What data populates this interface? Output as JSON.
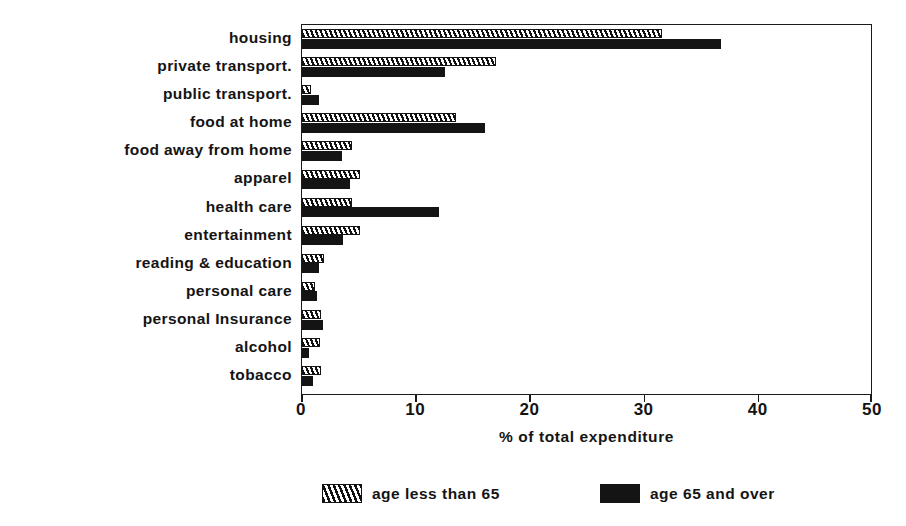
{
  "chart_data": {
    "type": "bar",
    "orientation": "horizontal",
    "title": "",
    "xlabel": "% of total expenditure",
    "ylabel": "",
    "xlim": [
      0,
      50
    ],
    "xticks": [
      0,
      10,
      20,
      30,
      40,
      50
    ],
    "xtick_labels": [
      "0",
      "10",
      "20",
      "30",
      "40",
      "50"
    ],
    "grid": false,
    "legend_position": "bottom",
    "categories": [
      "housing",
      "private transport.",
      "public transport.",
      "food at home",
      "food away from home",
      "apparel",
      "health care",
      "entertainment",
      "reading & education",
      "personal care",
      "personal Insurance",
      "alcohol",
      "tobacco"
    ],
    "series": [
      {
        "name": "age less than 65",
        "pattern": "diagonal-hatch",
        "color": "#ffffff",
        "values": [
          31.5,
          17.0,
          0.8,
          13.5,
          4.4,
          5.1,
          4.4,
          5.1,
          1.9,
          1.1,
          1.7,
          1.6,
          1.7
        ]
      },
      {
        "name": "age 65 and over",
        "pattern": "solid",
        "color": "#141414",
        "values": [
          36.7,
          12.5,
          1.5,
          16.0,
          3.5,
          4.2,
          12.0,
          3.6,
          1.5,
          1.3,
          1.8,
          0.6,
          1.0
        ]
      }
    ]
  },
  "legend": {
    "items": [
      {
        "label": "age less than 65",
        "pattern": "diagonal-hatch"
      },
      {
        "label": "age 65 and over",
        "pattern": "solid"
      }
    ]
  }
}
